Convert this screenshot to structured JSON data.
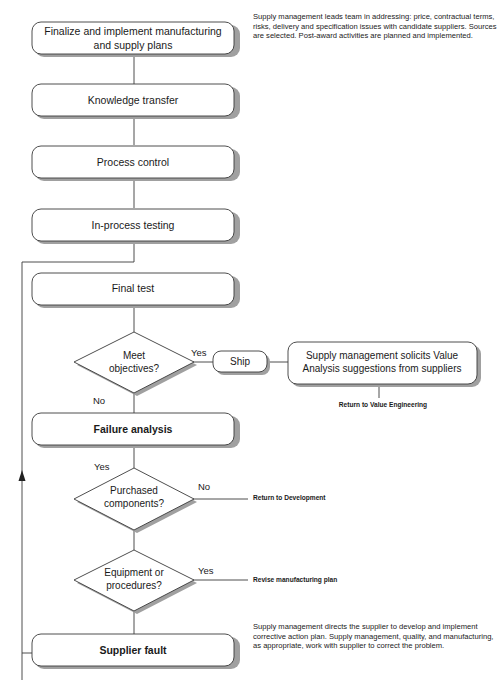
{
  "diagram": {
    "steps": [
      {
        "id": "finalize",
        "label_line1": "Finalize and implement manufacturing",
        "label_line2": "and supply plans",
        "bold": false
      },
      {
        "id": "knowledge",
        "label": "Knowledge transfer",
        "bold": false
      },
      {
        "id": "process_control",
        "label": "Process control",
        "bold": false
      },
      {
        "id": "in_process_testing",
        "label": "In-process testing",
        "bold": false
      },
      {
        "id": "final_test",
        "label": "Final test",
        "bold": false
      },
      {
        "id": "failure_analysis",
        "label": "Failure analysis",
        "bold": true
      },
      {
        "id": "supplier_fault",
        "label": "Supplier fault",
        "bold": true
      }
    ],
    "decisions": [
      {
        "id": "meet_objectives",
        "line1": "Meet",
        "line2": "objectives?",
        "yes_label": "Yes",
        "no_label": "No"
      },
      {
        "id": "purchased_components",
        "line1": "Purchased",
        "line2": "components?",
        "yes_label": "Yes",
        "no_label": "No"
      },
      {
        "id": "equipment_procedures",
        "line1": "Equipment or",
        "line2": "procedures?",
        "yes_label": "Yes"
      }
    ],
    "ship": {
      "label": "Ship"
    },
    "value_analysis": {
      "line1": "Supply management solicits Value",
      "line2": "Analysis suggestions from suppliers"
    },
    "outcomes": {
      "return_value_engineering": "Return to Value Engineering",
      "return_development": "Return to Development",
      "revise_plan": "Revise manufacturing plan"
    },
    "notes": {
      "top": "Supply management leads team in addressing: price, contractual terms, risks, delivery and specification issues with candidate suppliers. Sources are selected. Post-award activities are planned and implemented.",
      "bottom": "Supply management directs the supplier to develop and implement corrective action plan. Supply management, quality, and manufacturing, as appropriate, work with supplier to correct the problem."
    }
  },
  "colors": {
    "stroke": "#3a3a3a",
    "shadow": "#9a9a9a",
    "fill": "#ffffff",
    "text": "#1a1a1a"
  }
}
